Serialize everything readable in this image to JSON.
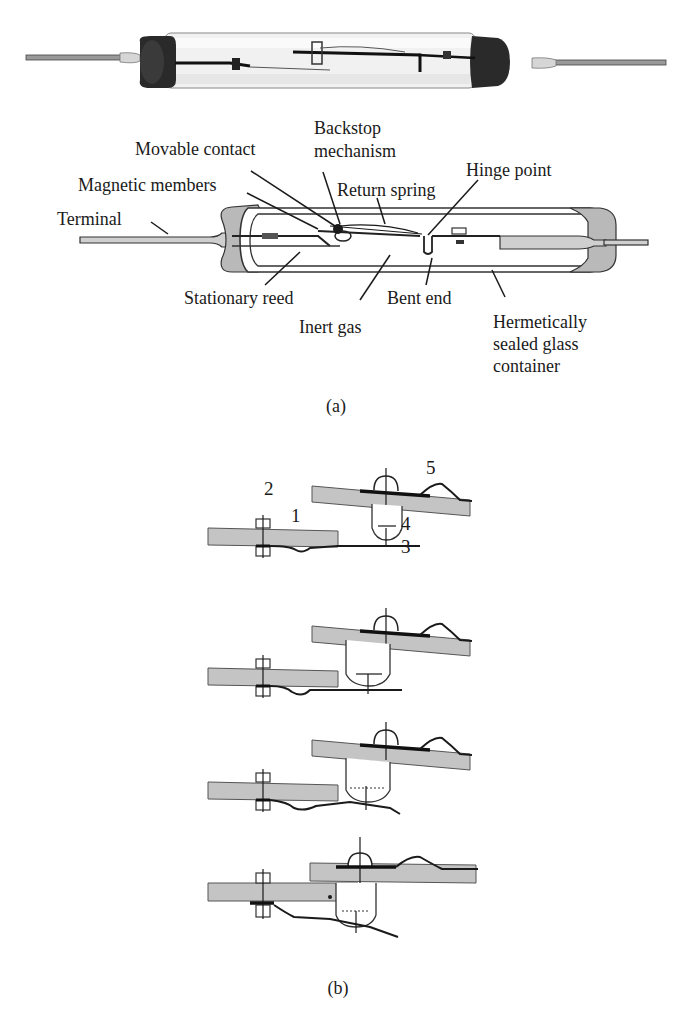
{
  "figure_a": {
    "caption": "(a)",
    "photo": {
      "description": "photograph of reed relay capsule"
    },
    "labels": {
      "backstop_line1": "Backstop",
      "backstop_line2": "mechanism",
      "movable_contact": "Movable contact",
      "hinge_point": "Hinge point",
      "magnetic_members": "Magnetic members",
      "return_spring": "Return spring",
      "terminal": "Terminal",
      "stationary_reed": "Stationary reed",
      "bent_end": "Bent end",
      "inert_gas": "Inert gas",
      "hermetic_line1": "Hermetically",
      "hermetic_line2": "sealed glass",
      "hermetic_line3": "container"
    }
  },
  "figure_b": {
    "caption": "(b)",
    "stages": 4,
    "part_numbers": [
      "1",
      "2",
      "3",
      "4",
      "5"
    ]
  },
  "colors": {
    "ink": "#1a1a1a",
    "plate_gray": "#c4c4c4",
    "glass_end_gray": "#b9b9b9",
    "background": "#ffffff"
  }
}
